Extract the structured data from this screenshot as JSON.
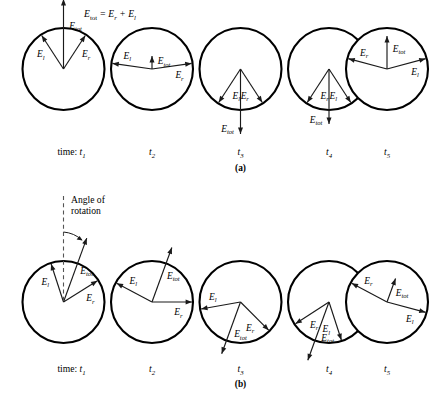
{
  "figure": {
    "equation": {
      "main": "E",
      "sub": "tot",
      "rest": " = E",
      "sub2": "r",
      "plus": " + E",
      "sub3": "l"
    },
    "equation_text": "E_tot = E_r + E_l",
    "annotation": {
      "line1": "Angle of",
      "line2": "rotation"
    },
    "labels": {
      "E": "E",
      "sub_tot": "tot",
      "sub_r": "r",
      "sub_l": "l"
    },
    "time_prefix": "time:",
    "time_labels": [
      "t",
      "t",
      "t",
      "t",
      "t"
    ],
    "time_subs": [
      "1",
      "2",
      "3",
      "4",
      "5"
    ],
    "panels": [
      {
        "id": "a",
        "label": "(a)",
        "caption": "Linear polarization, no rotation",
        "frames": [
          {
            "time": "t1",
            "vectors": [
              {
                "name": "E_l",
                "label_sub": "l",
                "angle_deg": 123,
                "length": 40
              },
              {
                "name": "E_r",
                "label_sub": "r",
                "angle_deg": 57,
                "length": 40
              },
              {
                "name": "E_tot",
                "label_sub": "tot",
                "angle_deg": 90,
                "length": 70
              }
            ]
          },
          {
            "time": "t2",
            "vectors": [
              {
                "name": "E_l",
                "label_sub": "l",
                "angle_deg": 172,
                "length": 40
              },
              {
                "name": "E_r",
                "label_sub": "r",
                "angle_deg": 8,
                "length": 40
              },
              {
                "name": "E_tot",
                "label_sub": "tot",
                "angle_deg": 90,
                "length": 13
              }
            ]
          },
          {
            "time": "t3",
            "vectors": [
              {
                "name": "E_l",
                "label_sub": "l",
                "angle_deg": 237,
                "length": 40
              },
              {
                "name": "E_r",
                "label_sub": "r",
                "angle_deg": 303,
                "length": 40
              },
              {
                "name": "E_tot",
                "label_sub": "tot",
                "angle_deg": 270,
                "length": 65
              }
            ]
          },
          {
            "time": "t4",
            "vectors": [
              {
                "name": "E_r",
                "label_sub": "r",
                "angle_deg": 237,
                "length": 40
              },
              {
                "name": "E_l",
                "label_sub": "l",
                "angle_deg": 303,
                "length": 40
              },
              {
                "name": "E_tot",
                "label_sub": "tot",
                "angle_deg": 270,
                "length": 55
              }
            ]
          },
          {
            "time": "t5",
            "vectors": [
              {
                "name": "E_r",
                "label_sub": "r",
                "angle_deg": 165,
                "length": 40
              },
              {
                "name": "E_l",
                "label_sub": "l",
                "angle_deg": 15,
                "length": 40
              },
              {
                "name": "E_tot",
                "label_sub": "tot",
                "angle_deg": 90,
                "length": 33
              }
            ]
          }
        ]
      },
      {
        "id": "b",
        "label": "(b)",
        "caption": "Rotated polarization plane",
        "rotation_marker": true,
        "frames": [
          {
            "time": "t1",
            "vectors": [
              {
                "name": "E_l",
                "label_sub": "l",
                "angle_deg": 108,
                "length": 40
              },
              {
                "name": "E_r",
                "label_sub": "r",
                "angle_deg": 32,
                "length": 40
              },
              {
                "name": "E_tot",
                "label_sub": "tot",
                "angle_deg": 70,
                "length": 68
              }
            ]
          },
          {
            "time": "t2",
            "vectors": [
              {
                "name": "E_l",
                "label_sub": "l",
                "angle_deg": 152,
                "length": 40
              },
              {
                "name": "E_r",
                "label_sub": "r",
                "angle_deg": 0,
                "length": 40
              },
              {
                "name": "E_tot",
                "label_sub": "tot",
                "angle_deg": 70,
                "length": 58
              }
            ]
          },
          {
            "time": "t3",
            "vectors": [
              {
                "name": "E_l",
                "label_sub": "l",
                "angle_deg": 190,
                "length": 40
              },
              {
                "name": "E_r",
                "label_sub": "r",
                "angle_deg": 315,
                "length": 40
              },
              {
                "name": "E_tot",
                "label_sub": "tot",
                "angle_deg": 250,
                "length": 55
              }
            ]
          },
          {
            "time": "t4",
            "vectors": [
              {
                "name": "E_r",
                "label_sub": "r",
                "angle_deg": 213,
                "length": 40
              },
              {
                "name": "E_l",
                "label_sub": "l",
                "angle_deg": 288,
                "length": 40
              },
              {
                "name": "E_tot",
                "label_sub": "tot",
                "angle_deg": 250,
                "length": 62
              }
            ]
          },
          {
            "time": "t5",
            "vectors": [
              {
                "name": "E_r",
                "label_sub": "r",
                "angle_deg": 152,
                "length": 40
              },
              {
                "name": "E_l",
                "label_sub": "l",
                "angle_deg": 345,
                "length": 40
              },
              {
                "name": "E_tot",
                "label_sub": "tot",
                "angle_deg": 70,
                "length": 25
              }
            ]
          }
        ]
      }
    ]
  }
}
